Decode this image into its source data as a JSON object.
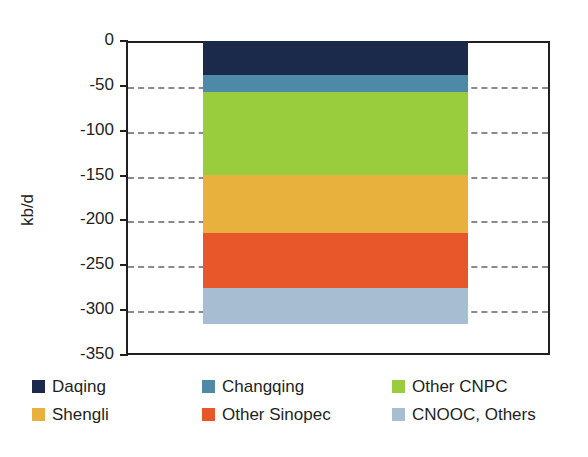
{
  "chart_data": {
    "type": "bar",
    "orientation": "vertical",
    "stacked": true,
    "title": "",
    "subtitle": "",
    "xlabel": "",
    "ylabel": "kb/d",
    "categories": [
      ""
    ],
    "ylim": [
      -350,
      0
    ],
    "ytick_labels": [
      "0",
      "-50",
      "-100",
      "-150",
      "-200",
      "-250",
      "-300",
      "-350"
    ],
    "ytick_values": [
      0,
      -50,
      -100,
      -150,
      -200,
      -250,
      -300,
      -350
    ],
    "grid": true,
    "grid_style": "dashed-horizontal",
    "legend_position": "bottom",
    "total": -315,
    "series": [
      {
        "name": "Daqing",
        "values": [
          -38
        ],
        "color": "#1b2a4a",
        "start": 0,
        "end": -38
      },
      {
        "name": "Changqing",
        "values": [
          -19
        ],
        "color": "#4e89a8",
        "start": -38,
        "end": -57
      },
      {
        "name": "Other CNPC",
        "values": [
          -92
        ],
        "color": "#9acd3e",
        "start": -57,
        "end": -149
      },
      {
        "name": "Shengli",
        "values": [
          -65
        ],
        "color": "#e8b03c",
        "start": -149,
        "end": -214
      },
      {
        "name": "Other Sinopec",
        "values": [
          -61
        ],
        "color": "#e8572a",
        "start": -214,
        "end": -275
      },
      {
        "name": "CNOOC, Others",
        "values": [
          -40
        ],
        "color": "#a7bdd1",
        "start": -275,
        "end": -315
      }
    ]
  },
  "axis": {
    "y_title": "kb/d"
  },
  "legend": {
    "entries": [
      {
        "label": "Daqing",
        "color": "#1b2a4a"
      },
      {
        "label": "Changqing",
        "color": "#4e89a8"
      },
      {
        "label": "Other CNPC",
        "color": "#9acd3e"
      },
      {
        "label": "Shengli",
        "color": "#e8b03c"
      },
      {
        "label": "Other Sinopec",
        "color": "#e8572a"
      },
      {
        "label": "CNOOC, Others",
        "color": "#a7bdd1"
      }
    ]
  }
}
